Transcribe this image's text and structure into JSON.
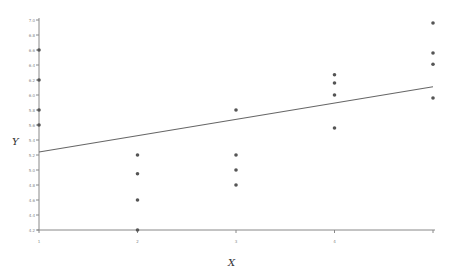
{
  "chart_data": {
    "type": "scatter",
    "title": "",
    "xlabel": "X",
    "ylabel": "Y",
    "xlim": [
      1,
      5
    ],
    "ylim": [
      4.2,
      7.0
    ],
    "grid": false,
    "legend": null,
    "x_ticks": [
      1,
      2,
      3,
      4,
      5
    ],
    "x_tick_labels": [
      "1",
      "2",
      "3",
      "4",
      ""
    ],
    "y_ticks": [
      4.2,
      4.4,
      4.6,
      4.8,
      5.0,
      5.2,
      5.4,
      5.6,
      5.8,
      6.0,
      6.2,
      6.4,
      6.6,
      6.8,
      7.0
    ],
    "y_tick_labels": [
      "4.2",
      "4.4",
      "4.6",
      "4.8",
      "5.0",
      "5.2",
      "5.4",
      "5.6",
      "5.8",
      "6.0",
      "6.2",
      "6.4",
      "6.6",
      "6.8",
      "7.0"
    ],
    "series": [
      {
        "name": "observations",
        "marker": "circle",
        "color": "#555555",
        "points": [
          [
            1,
            6.6
          ],
          [
            1,
            6.2
          ],
          [
            1,
            5.8
          ],
          [
            1,
            5.6
          ],
          [
            2,
            5.2
          ],
          [
            2,
            4.95
          ],
          [
            2,
            4.6
          ],
          [
            2,
            4.2
          ],
          [
            3,
            5.8
          ],
          [
            3,
            5.2
          ],
          [
            3,
            5.0
          ],
          [
            3,
            4.8
          ],
          [
            4,
            6.27
          ],
          [
            4,
            6.16
          ],
          [
            4,
            6.0
          ],
          [
            4,
            5.56
          ],
          [
            5,
            6.96
          ],
          [
            5,
            6.56
          ],
          [
            5,
            6.41
          ],
          [
            5,
            5.96
          ]
        ]
      }
    ],
    "fit_line": {
      "name": "regression line",
      "color": "#666666",
      "x": [
        1,
        5
      ],
      "y": [
        5.24,
        6.11
      ]
    }
  },
  "colors": {
    "axis": "#888888",
    "points": "#555555",
    "line": "#666666"
  }
}
